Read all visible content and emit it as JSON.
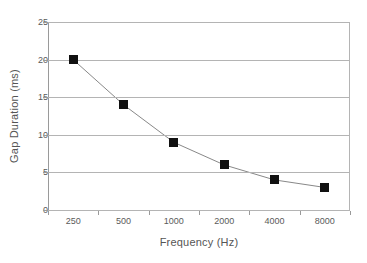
{
  "chart_data": {
    "type": "line",
    "title": "",
    "subtitle": "",
    "xlabel": "Frequency (Hz)",
    "ylabel": "Gap Duration (ms)",
    "categories": [
      "250",
      "500",
      "1000",
      "2000",
      "4000",
      "8000"
    ],
    "values": [
      20,
      14,
      9,
      6,
      4,
      3
    ],
    "series": [
      {
        "name": "Gap Duration",
        "values": [
          20,
          14,
          9,
          6,
          4,
          3
        ]
      }
    ],
    "ylim": [
      0,
      25
    ],
    "yticks": [
      "0",
      "5",
      "10",
      "15",
      "20",
      "25"
    ],
    "ytick_values": [
      0,
      5,
      10,
      15,
      20,
      25
    ],
    "grid": "horizontal",
    "legend": "none",
    "marker": "filled-square",
    "marker_color": "#111111",
    "line_color": "#888888",
    "gridline_color": "#b4b4b4",
    "axis_color": "#9a9a9a",
    "background_color": "#ffffff",
    "annotations": []
  }
}
